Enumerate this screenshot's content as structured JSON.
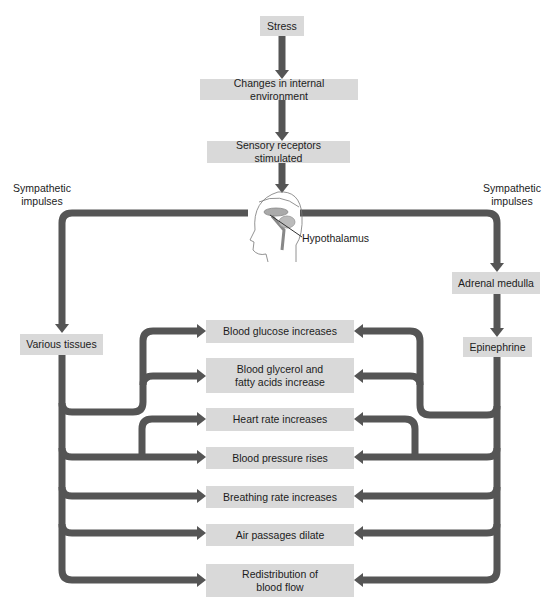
{
  "diagram": {
    "flow": {
      "stress": "Stress",
      "changes": "Changes in internal environment",
      "sensory": "Sensory receptors stimulated",
      "hypothalamus": "Hypothalamus"
    },
    "left_branch": {
      "label": "Sympathetic impulses",
      "target": "Various tissues"
    },
    "right_branch": {
      "label": "Sympathetic impulses",
      "target": "Adrenal medulla",
      "hormone": "Epinephrine"
    },
    "effects": [
      {
        "label": "Blood glucose increases"
      },
      {
        "label": "Blood glycerol and fatty acids increase"
      },
      {
        "label": "Heart rate increases"
      },
      {
        "label": "Blood pressure rises"
      },
      {
        "label": "Breathing rate increases"
      },
      {
        "label": "Air passages dilate"
      },
      {
        "label": "Redistribution of blood flow"
      }
    ],
    "colors": {
      "box_fill": "#d9d9d9",
      "arrow": "#555555",
      "background": "#ffffff"
    }
  }
}
